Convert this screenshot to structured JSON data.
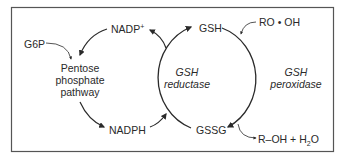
{
  "diagram": {
    "frame_color": "#555555",
    "line_color": "#2a2a2a",
    "nodes": {
      "nadp_plus": {
        "base": "NADP",
        "sup": "+"
      },
      "nadph": {
        "text": "NADPH"
      },
      "g6p": {
        "text": "G6P"
      },
      "ppp": {
        "line1": "Pentose",
        "line2": "phosphate",
        "line3": "pathway"
      },
      "gsh": {
        "text": "GSH"
      },
      "gssg": {
        "text": "GSSG"
      },
      "ro_oh": {
        "text": "RO • OH"
      },
      "products": {
        "prefix": "R–OH + H",
        "sub": "2",
        "suffix": "O"
      }
    },
    "enzymes": {
      "reductase": {
        "line1": "GSH",
        "line2": "reductase"
      },
      "peroxidase": {
        "line1": "GSH",
        "line2": "peroxidase"
      }
    },
    "edges": [
      {
        "from": "NADP+",
        "to": "Pentose phosphate pathway"
      },
      {
        "from": "G6P",
        "to": "Pentose phosphate pathway"
      },
      {
        "from": "Pentose phosphate pathway",
        "to": "NADPH"
      },
      {
        "from": "NADPH",
        "to": "GSH reductase cycle"
      },
      {
        "from": "GSH reductase cycle",
        "to": "NADP+"
      },
      {
        "from": "GSSG",
        "to": "GSH",
        "via": "GSH reductase"
      },
      {
        "from": "GSH",
        "to": "GSSG",
        "via": "GSH peroxidase"
      },
      {
        "from": "RO • OH",
        "to": "GSH peroxidase"
      },
      {
        "from": "GSH peroxidase",
        "to": "R–OH + H2O"
      }
    ]
  }
}
